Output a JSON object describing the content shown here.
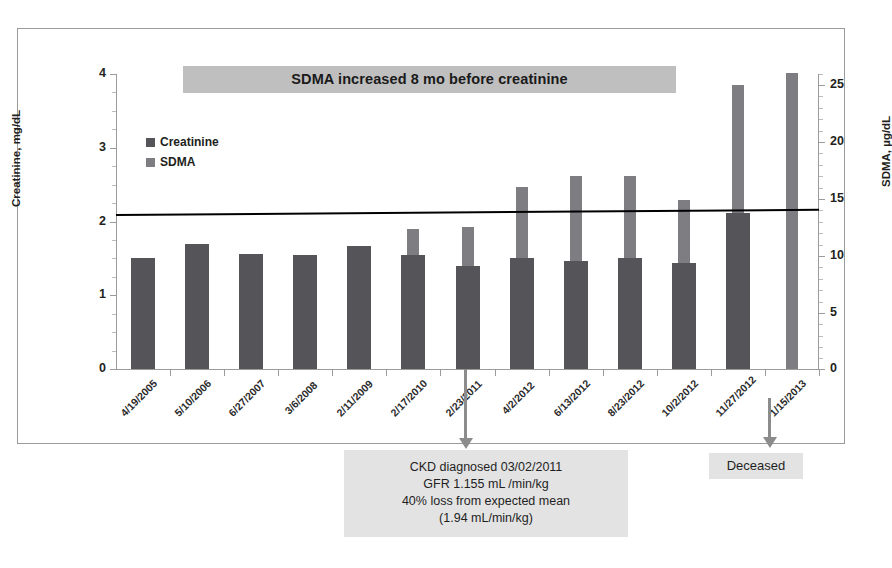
{
  "chart_data": {
    "type": "bar",
    "title": "SDMA increased 8 mo before creatinine",
    "xlabel": "",
    "ylabel": "Creatinine, mg/dL",
    "y2label": "SDMA, µg/dL",
    "ylim": [
      0,
      4
    ],
    "y2lim": [
      0,
      26
    ],
    "yticks": [
      "0",
      "1",
      "2",
      "3",
      "4"
    ],
    "y2ticks": [
      "0",
      "5",
      "10",
      "15",
      "20",
      "25"
    ],
    "grid": false,
    "legend_position": "upper-left",
    "categories": [
      "4/19/2005",
      "5/10/2006",
      "6/27/2007",
      "3/6/2008",
      "2/11/2009",
      "2/17/2010",
      "2/23/2011",
      "4/2/2012",
      "6/13/2012",
      "8/23/2012",
      "10/2/2012",
      "11/27/2012",
      "1/15/2013"
    ],
    "series": [
      {
        "name": "Creatinine",
        "axis": "left",
        "units": "mg/dL",
        "color": "#555559",
        "values": [
          1.5,
          1.69,
          1.56,
          1.54,
          1.67,
          1.54,
          1.4,
          1.5,
          1.46,
          1.5,
          1.44,
          2.11,
          null
        ]
      },
      {
        "name": "SDMA",
        "axis": "right",
        "units": "µg/dL",
        "color": "#7d7d82",
        "values": [
          null,
          null,
          null,
          null,
          null,
          12.3,
          12.5,
          16.0,
          17.0,
          17.0,
          14.9,
          25.0,
          26.1
        ]
      }
    ],
    "trendline": {
      "name": "creatinine-trend",
      "y_start": 2.1,
      "y_end": 2.17,
      "color": "#000000"
    },
    "annotations": [
      {
        "name": "ckd-note",
        "target_category": "4/2/2012",
        "lines": [
          "CKD diagnosed 03/02/2011",
          "GFR 1.155 mL /min/kg",
          "40% loss from expected mean",
          "(1.94 mL/min/kg)"
        ]
      },
      {
        "name": "deceased-note",
        "target_category": "1/15/2013",
        "lines": [
          "Deceased"
        ]
      }
    ]
  },
  "legend": {
    "items": [
      {
        "label": "Creatinine",
        "color": "#555559"
      },
      {
        "label": "SDMA",
        "color": "#7d7d82"
      }
    ]
  },
  "notes": {
    "ckd": {
      "line1": "CKD diagnosed 03/02/2011",
      "line2": "GFR 1.155 mL /min/kg",
      "line3": "40% loss from expected mean",
      "line4": "(1.94 mL/min/kg)"
    },
    "deceased": {
      "label": "Deceased"
    }
  }
}
